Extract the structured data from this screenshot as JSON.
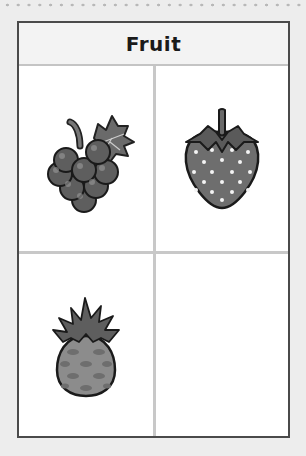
{
  "worksheet": {
    "title": "Fruit",
    "cells": [
      {
        "position": "top-left",
        "item": "grapes",
        "icon": "grapes-icon"
      },
      {
        "position": "top-right",
        "item": "strawberry",
        "icon": "strawberry-icon"
      },
      {
        "position": "bottom-left",
        "item": "pineapple",
        "icon": "pineapple-icon"
      },
      {
        "position": "bottom-right",
        "item": "",
        "icon": ""
      }
    ]
  },
  "colors": {
    "border": "#4a4a4a",
    "divider": "#c8c8c8",
    "fruit_fill": "#6e6e6e",
    "background": "#ededed"
  }
}
